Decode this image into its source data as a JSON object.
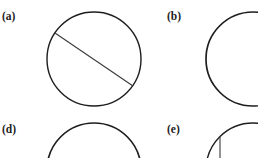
{
  "figure": {
    "panels": [
      {
        "id": "a",
        "label": "(a)",
        "label_pos": [
          2,
          20
        ],
        "circle": {
          "cx": 94,
          "cy": 59,
          "r": 47,
          "stroke_width": 1.4
        },
        "chord": {
          "x1": 55,
          "y1": 33,
          "x2": 133,
          "y2": 86
        }
      },
      {
        "id": "b",
        "label": "(b)",
        "label_pos": [
          167,
          20
        ],
        "circle": {
          "cx": 253,
          "cy": 59,
          "r": 47,
          "stroke_width": 1.7
        }
      },
      {
        "id": "d",
        "label": "(d)",
        "label_pos": [
          2,
          133
        ],
        "circle": {
          "cx": 94,
          "cy": 170,
          "r": 47,
          "stroke_width": 1.7
        }
      },
      {
        "id": "e",
        "label": "(e)",
        "label_pos": [
          167,
          133
        ],
        "circle": {
          "cx": 253,
          "cy": 170,
          "r": 47,
          "stroke_width": 1.4
        },
        "chord": {
          "x1": 220,
          "y1": 136,
          "x2": 220,
          "y2": 158
        }
      }
    ],
    "colors": {
      "background": "#ffffff",
      "stroke": "#1e1e1e",
      "chord": "#3a3a3a",
      "label": "#222222"
    }
  }
}
